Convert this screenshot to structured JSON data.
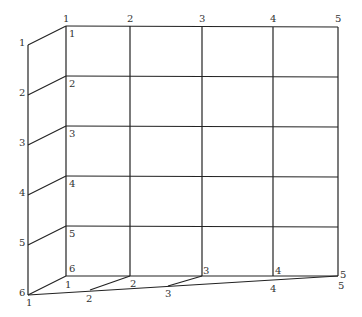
{
  "diagram": {
    "type": "3d-grid-perspective",
    "stroke_color": "#222222",
    "label_color": "#333333",
    "back_top_labels": [
      "1",
      "2",
      "3",
      "4",
      "5"
    ],
    "back_left_labels": [
      "1",
      "2",
      "3",
      "4",
      "5",
      "6"
    ],
    "side_left_labels": [
      "1",
      "2",
      "3",
      "4",
      "5",
      "6"
    ],
    "back_bottom_labels": [
      "1",
      "2",
      "3",
      "4",
      "5"
    ],
    "front_bottom_labels": [
      "1",
      "2",
      "3",
      "4",
      "5"
    ]
  }
}
